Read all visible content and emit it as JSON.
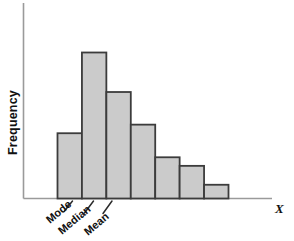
{
  "figure": {
    "background_color": "#ffffff",
    "width": 294,
    "height": 241
  },
  "axes": {
    "y_axis_label": "Frequency",
    "x_axis_label": "X",
    "axis_color": "#9a9a9a"
  },
  "bars": {
    "fill_color": "#cbcbcb",
    "border_color": "#3c3c3c"
  },
  "annotations": {
    "mode": "Mode",
    "median": "Median",
    "mean": "Mean"
  },
  "chart_data": {
    "type": "bar",
    "title": "",
    "subtitle": "",
    "xlabel": "X",
    "ylabel": "Frequency",
    "categories": [
      "1",
      "2",
      "3",
      "4",
      "5",
      "6",
      "7"
    ],
    "values": [
      38,
      85,
      62,
      43,
      24,
      19,
      8
    ],
    "ylim": [
      0,
      95
    ],
    "grid": false,
    "legend": false,
    "legend_position": "none",
    "bar_fill": "#cbcbcb",
    "bar_edge": "#3c3c3c",
    "distribution_shape": "right-skewed (positively skewed)",
    "annotations": [
      {
        "label": "Mode",
        "bar_index": 1,
        "relation": "Mode < Median < Mean"
      },
      {
        "label": "Median",
        "bar_index": 2,
        "relation": "Mode < Median < Mean"
      },
      {
        "label": "Mean",
        "bar_index": 2,
        "relation": "Mode < Median < Mean"
      }
    ],
    "tick_labels_x": [],
    "tick_labels_y": []
  }
}
